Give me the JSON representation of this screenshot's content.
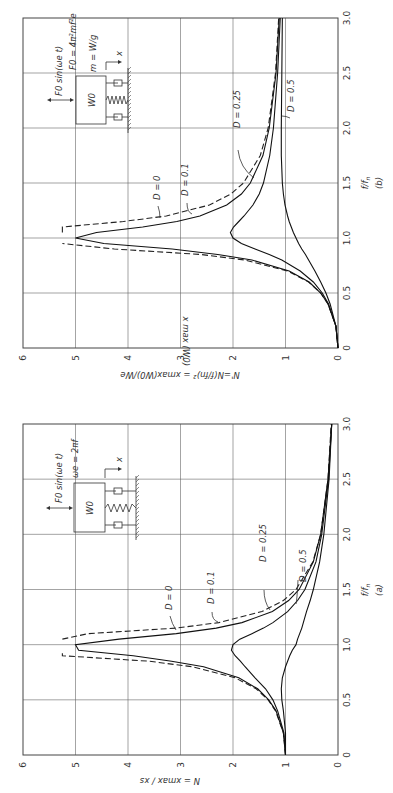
{
  "figure": {
    "rotation_deg": -90,
    "colors": {
      "background": "#ffffff",
      "ink": "#222222"
    }
  },
  "chart_data": [
    {
      "id": "b",
      "type": "line",
      "panel_label": "(b)",
      "title": "",
      "xlabel": "f/f_n",
      "ylabel": "N' = N (f/f_n)^2 = x_max (W_0) / W_e",
      "xlim": [
        0,
        3.0
      ],
      "ylim": [
        0,
        6
      ],
      "xticks": [
        "0",
        "0.5",
        "1.0",
        "1.5",
        "2.0",
        "2.5",
        "3.0"
      ],
      "yticks": [
        "0",
        "1",
        "2",
        "3",
        "4",
        "5",
        "6"
      ],
      "grid": true,
      "diagram": {
        "force_label": "F_0 sin(ω_e t)",
        "force_eq": "F_0 = 4π²mf²e",
        "mass_eq": "m = W/g",
        "mass_label": "W_0",
        "disp_label": "x"
      },
      "x": [
        0,
        0.2,
        0.4,
        0.5,
        0.6,
        0.7,
        0.8,
        0.85,
        0.9,
        0.95,
        1.0,
        1.05,
        1.1,
        1.15,
        1.2,
        1.3,
        1.4,
        1.5,
        1.75,
        2.0,
        2.5,
        3.0
      ],
      "series": [
        {
          "name": "D = 0",
          "style": "dashed",
          "values": [
            0,
            0.04,
            0.19,
            0.33,
            0.56,
            0.96,
            1.78,
            2.61,
            4.26,
            9.26,
            null,
            10.75,
            5.76,
            4.09,
            3.27,
            2.45,
            2.04,
            1.8,
            1.48,
            1.33,
            1.19,
            1.13
          ]
        },
        {
          "name": "D = 0.1",
          "style": "solid",
          "values": [
            0,
            0.04,
            0.19,
            0.33,
            0.55,
            0.93,
            1.64,
            2.29,
            3.16,
            4.46,
            5.0,
            4.6,
            3.72,
            3.07,
            2.63,
            2.12,
            1.84,
            1.67,
            1.43,
            1.31,
            1.18,
            1.12
          ]
        },
        {
          "name": "D = 0.25",
          "style": "solid",
          "values": [
            0,
            0.04,
            0.18,
            0.3,
            0.47,
            0.72,
            1.07,
            1.31,
            1.58,
            1.84,
            2.0,
            2.05,
            1.99,
            1.89,
            1.79,
            1.62,
            1.5,
            1.42,
            1.3,
            1.23,
            1.15,
            1.1
          ]
        },
        {
          "name": "D = 0.5",
          "style": "solid",
          "values": [
            0,
            0.04,
            0.15,
            0.23,
            0.33,
            0.44,
            0.56,
            0.62,
            0.69,
            0.75,
            0.8,
            0.85,
            0.89,
            0.93,
            0.96,
            1.01,
            1.04,
            1.06,
            1.08,
            1.08,
            1.07,
            1.06
          ]
        }
      ],
      "annotations": [
        "D = 0",
        "D = 0.1",
        "D = 0.25",
        "D = 0.5"
      ]
    },
    {
      "id": "a",
      "type": "line",
      "panel_label": "(a)",
      "title": "",
      "xlabel": "f/f_n",
      "ylabel": "N = x_max / x_s",
      "xlim": [
        0,
        3.0
      ],
      "ylim": [
        0,
        6
      ],
      "xticks": [
        "0",
        "0.5",
        "1.0",
        "1.5",
        "2.0",
        "2.5",
        "3.0"
      ],
      "yticks": [
        "0",
        "1",
        "2",
        "3",
        "4",
        "5",
        "6"
      ],
      "grid": true,
      "diagram": {
        "force_label": "F_0 sin(ω_e t)",
        "force_eq": "ω_e = 2πf",
        "mass_label": "W_0",
        "disp_label": "x"
      },
      "x": [
        0,
        0.2,
        0.4,
        0.5,
        0.6,
        0.7,
        0.8,
        0.85,
        0.9,
        0.95,
        1.0,
        1.05,
        1.1,
        1.15,
        1.2,
        1.3,
        1.4,
        1.5,
        1.75,
        2.0,
        2.5,
        3.0
      ],
      "series": [
        {
          "name": "D = 0",
          "style": "dashed",
          "values": [
            1.0,
            1.04,
            1.19,
            1.33,
            1.56,
            1.96,
            2.78,
            3.6,
            5.26,
            10.26,
            null,
            9.76,
            4.76,
            3.09,
            2.27,
            1.45,
            1.04,
            0.8,
            0.48,
            0.33,
            0.19,
            0.13
          ]
        },
        {
          "name": "D = 0.1",
          "style": "solid",
          "values": [
            1.0,
            1.04,
            1.18,
            1.32,
            1.53,
            1.89,
            2.56,
            3.17,
            3.9,
            4.94,
            5.0,
            4.17,
            3.08,
            2.32,
            1.83,
            1.25,
            0.94,
            0.74,
            0.47,
            0.33,
            0.19,
            0.12
          ]
        },
        {
          "name": "D = 0.25",
          "style": "solid",
          "values": [
            1.0,
            1.03,
            1.15,
            1.24,
            1.38,
            1.58,
            1.77,
            1.86,
            1.96,
            2.03,
            2.0,
            1.87,
            1.64,
            1.42,
            1.24,
            0.96,
            0.77,
            0.63,
            0.42,
            0.31,
            0.18,
            0.12
          ]
        },
        {
          "name": "D = 0.5",
          "style": "solid",
          "values": [
            1.0,
            1.0,
            1.04,
            1.07,
            1.08,
            1.06,
            1.0,
            0.96,
            0.92,
            0.87,
            0.8,
            0.77,
            0.73,
            0.69,
            0.66,
            0.6,
            0.53,
            0.47,
            0.35,
            0.27,
            0.17,
            0.12
          ]
        }
      ],
      "annotations": [
        "D = 0",
        "D = 0.1",
        "D = 0.25",
        "D = 0.5"
      ]
    }
  ],
  "labels": {
    "b": {
      "panel": "(b)",
      "xaxis": "f/f",
      "xaxis_sub": "n",
      "yaxis": "N' = N (f/f",
      "yaxis_tail": "n)² = x",
      "yaxis_frac_num": "x max (W0)",
      "yaxis_frac_den": "We",
      "force": "F0 sin(ωe t)",
      "force_eq": "F0 = 4π²mf²e",
      "mass_eq": "m = W/g",
      "mass": "W0",
      "disp": "x",
      "ann_d0": "D = 0",
      "ann_d01": "D = 0.1",
      "ann_d025": "D = 0.25",
      "ann_d05": "D = 0.5"
    },
    "a": {
      "panel": "(a)",
      "xaxis": "f/f",
      "xaxis_sub": "n",
      "yaxis": "N =",
      "yaxis_frac_num": "x max",
      "yaxis_frac_den": "xs",
      "force": "F0 sin(ωe t)",
      "force_eq": "ωe = 2πf",
      "mass": "W0",
      "disp": "x",
      "ann_d0": "D = 0",
      "ann_d01": "D = 0.1",
      "ann_d025": "D = 0.25",
      "ann_d05": "D = 0.5"
    }
  }
}
